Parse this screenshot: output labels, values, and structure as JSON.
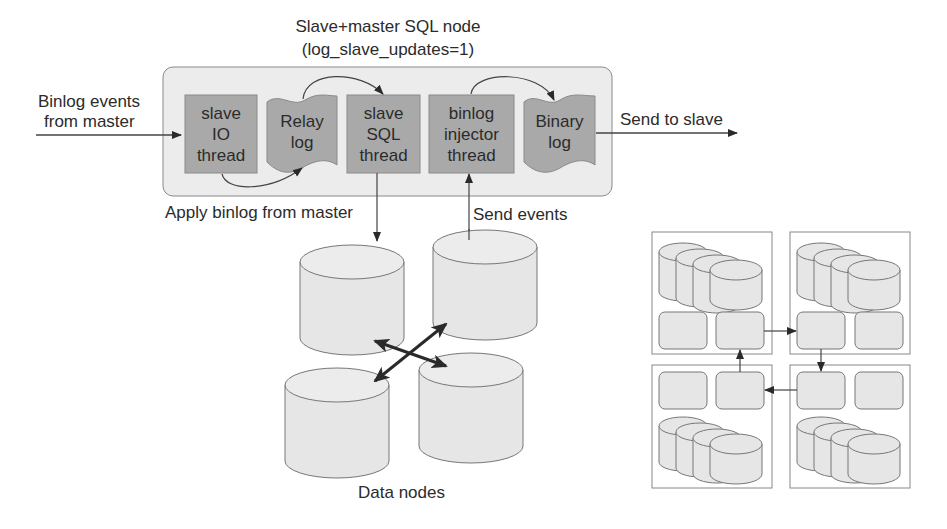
{
  "diagram": {
    "title_line1": "Slave+master SQL node",
    "title_line2": "(log_slave_updates=1)",
    "input_label_line1": "Binlog events",
    "input_label_line2": "from master",
    "output_label": "Send to slave",
    "apply_label": "Apply binlog from master",
    "send_events_label": "Send events",
    "data_nodes_label": "Data nodes",
    "components": [
      {
        "id": "slave-io-thread",
        "type": "thread",
        "lines": [
          "slave",
          "IO",
          "thread"
        ]
      },
      {
        "id": "relay-log",
        "type": "log",
        "lines": [
          "Relay",
          "log"
        ]
      },
      {
        "id": "slave-sql-thread",
        "type": "thread",
        "lines": [
          "slave",
          "SQL",
          "thread"
        ]
      },
      {
        "id": "binlog-injector-thread",
        "type": "thread",
        "lines": [
          "binlog",
          "injector",
          "thread"
        ]
      },
      {
        "id": "binary-log",
        "type": "log",
        "lines": [
          "Binary",
          "log"
        ]
      }
    ],
    "colors": {
      "panel_fill": "#ececec",
      "panel_stroke": "#8a8a8a",
      "thread_fill": "#a9a9a9",
      "log_fill": "#a9a9a9",
      "cylinder_fill": "#e6e6e6",
      "stroke": "#6e6e6e",
      "arrow": "#2a2a2a"
    }
  }
}
